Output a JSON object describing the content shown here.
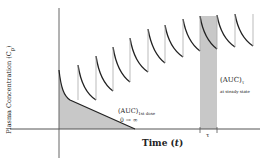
{
  "diagram": {
    "y_axis_label": "Plasma Concentration (C",
    "y_axis_sub": "p",
    "y_axis_close": ")",
    "x_axis_label": "Time (",
    "x_axis_var": "t",
    "x_axis_close": ")",
    "auc_first_main": "(AUC)",
    "auc_first_sub": "1st dose",
    "auc_first_range": "0 → ∞",
    "auc_tau_main": "(AUC)",
    "auc_tau_sub": "τ",
    "auc_tau_note": "at steady state",
    "tau_label": "τ",
    "colors": {
      "curve": "#222222",
      "shade": "#c8c8c8",
      "axis": "#555555"
    }
  }
}
